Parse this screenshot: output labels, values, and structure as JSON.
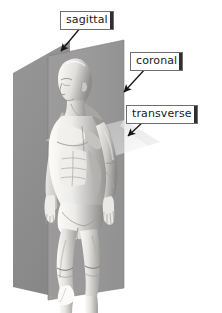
{
  "diagram": {
    "background_color": "#ffffff",
    "labels": [
      {
        "id": "sagittal",
        "text": "sagittal",
        "description": "vertical plane dividing body into left and right",
        "box_color": "#ffffff",
        "border_color": "#6e6e6e",
        "text_color": "#1a1a1a"
      },
      {
        "id": "coronal",
        "text": "coronal",
        "description": "vertical plane dividing body into front and back",
        "box_color": "#ffffff",
        "border_color": "#6e6e6e",
        "text_color": "#1a1a1a"
      },
      {
        "id": "transverse",
        "text": "transverse",
        "description": "horizontal plane dividing body into upper and lower",
        "box_color": "#ffffff",
        "border_color": "#6e6e6e",
        "text_color": "#1a1a1a"
      }
    ],
    "planes": [
      {
        "id": "coronal-plane",
        "fill": "#9a9a9a",
        "opacity": 0.95
      },
      {
        "id": "sagittal-plane",
        "fill": "#8a8a8a",
        "opacity": 0.85
      },
      {
        "id": "transverse-plane",
        "fill": "#d8d8d8",
        "opacity": 0.75
      }
    ],
    "leader_lines": [
      {
        "id": "sagittal-arrow",
        "color": "#1a1a1a"
      },
      {
        "id": "coronal-arrow",
        "color": "#1a1a1a"
      },
      {
        "id": "transverse-arrow",
        "color": "#1a1a1a"
      }
    ]
  }
}
